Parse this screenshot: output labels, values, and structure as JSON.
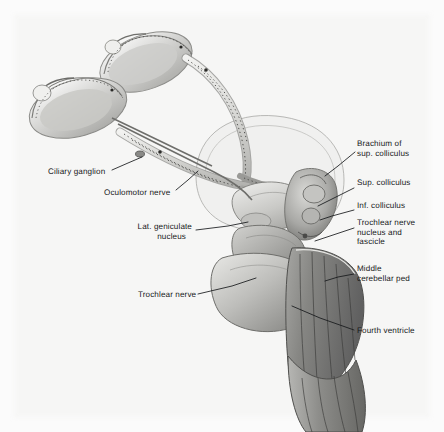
{
  "figure": {
    "medium": "grayscale halftone anatomical illustration",
    "background_color": "#fbfbfb",
    "ink_color": "#16181a",
    "width": 444,
    "height": 432
  },
  "labels": [
    {
      "id": "brachium-of-sup-colliculus",
      "line1": "Brachium of",
      "line2": "sup. colliculus",
      "x": 357,
      "y": 143,
      "align": "left",
      "leader": [
        [
          355,
          152
        ],
        [
          338,
          166
        ],
        [
          325,
          176
        ]
      ]
    },
    {
      "id": "sup-colliculus",
      "line1": "Sup. colliculus",
      "line2": "",
      "x": 357,
      "y": 182,
      "align": "left",
      "leader": [
        [
          354,
          188
        ],
        [
          330,
          200
        ],
        [
          318,
          206
        ]
      ]
    },
    {
      "id": "inf-colliculus",
      "line1": "Inf. colliculus",
      "line2": "",
      "x": 357,
      "y": 205,
      "align": "left",
      "leader": [
        [
          354,
          210
        ],
        [
          332,
          216
        ],
        [
          320,
          220
        ]
      ]
    },
    {
      "id": "trochlear-nerve-nucleus-and-fascicle",
      "line1": "Trochlear nerve",
      "line2": "nucleus and",
      "line3": "fascicle",
      "x": 357,
      "y": 222,
      "align": "left",
      "leader": [
        [
          354,
          228
        ],
        [
          330,
          236
        ],
        [
          315,
          241
        ]
      ]
    },
    {
      "id": "middle-cerebellar-peduncle",
      "line1": "Middle",
      "line2": "cerebellar ped",
      "x": 357,
      "y": 268,
      "align": "left",
      "leader": [
        [
          354,
          274
        ],
        [
          338,
          277
        ],
        [
          325,
          281
        ]
      ]
    },
    {
      "id": "fourth-ventricle",
      "line1": "Fourth ventricle",
      "line2": "",
      "x": 357,
      "y": 330,
      "align": "left",
      "leader": [
        [
          354,
          330
        ],
        [
          320,
          318
        ],
        [
          292,
          306
        ]
      ]
    },
    {
      "id": "ciliary-ganglion",
      "line1": "Ciliary ganglion",
      "line2": "",
      "x": 48,
      "y": 171,
      "align": "left",
      "leader": [
        [
          112,
          170
        ],
        [
          128,
          163
        ],
        [
          142,
          157
        ]
      ]
    },
    {
      "id": "oculomotor-nerve",
      "line1": "Oculomotor nerve",
      "line2": "",
      "x": 104,
      "y": 192,
      "align": "left",
      "leader": [
        [
          176,
          190
        ],
        [
          188,
          180
        ],
        [
          198,
          171
        ]
      ]
    },
    {
      "id": "lat-geniculate-nucleus",
      "line1": "Lat. geniculate",
      "line2": "nucleus",
      "x": 190,
      "y": 226,
      "align": "right",
      "leader": [
        [
          196,
          230
        ],
        [
          228,
          226
        ],
        [
          248,
          222
        ]
      ]
    },
    {
      "id": "trochlear-nerve",
      "line1": "Trochlear nerve",
      "line2": "",
      "x": 140,
      "y": 294,
      "align": "right",
      "leader": [
        [
          198,
          294
        ],
        [
          232,
          286
        ],
        [
          256,
          278
        ]
      ]
    }
  ],
  "structures": [
    {
      "id": "left-eyeball",
      "name": "sectioned eyeball (left/lower)"
    },
    {
      "id": "right-eyeball",
      "name": "sectioned eyeball (right/upper)"
    },
    {
      "id": "optic-nerves",
      "name": "optic nerves"
    },
    {
      "id": "optic-chiasm",
      "name": "optic chiasm"
    },
    {
      "id": "optic-tracts",
      "name": "optic tracts with dotted fibers"
    },
    {
      "id": "cerebral-hemisphere-outline",
      "name": "cerebral hemisphere ghost outline"
    },
    {
      "id": "thalamus",
      "name": "thalamus"
    },
    {
      "id": "midbrain-tectum",
      "name": "midbrain tectum with colliculi"
    },
    {
      "id": "cerebral-peduncle",
      "name": "cerebral peduncle"
    },
    {
      "id": "pons",
      "name": "pons"
    },
    {
      "id": "middle-cerebellar-peduncle-body",
      "name": "middle cerebellar peduncle"
    },
    {
      "id": "rhomboid-fossa",
      "name": "rhomboid fossa / floor of fourth ventricle"
    },
    {
      "id": "medulla",
      "name": "medulla oblongata"
    }
  ]
}
